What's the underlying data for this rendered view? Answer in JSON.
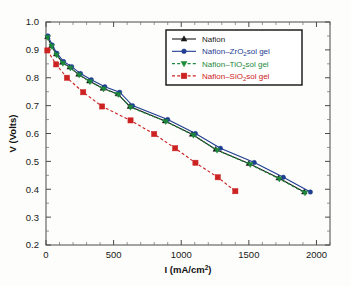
{
  "chart_data": {
    "type": "line",
    "title": "",
    "xlabel": "I (mA/cm2)",
    "xlabel_prefix": "I (mA/cm",
    "xlabel_sup": "2",
    "xlabel_suffix": ")",
    "ylabel": "V (Volts)",
    "xlim": [
      0,
      2100
    ],
    "ylim": [
      0.2,
      1.0
    ],
    "xticks": [
      0,
      500,
      1000,
      1500,
      2000
    ],
    "xticklabels": [
      "0",
      "500",
      "1000",
      "1500",
      "2000"
    ],
    "x_minor_step": 100,
    "yticks": [
      0.2,
      0.3,
      0.4,
      0.5,
      0.6,
      0.7,
      0.8,
      0.9,
      1.0
    ],
    "yticklabels": [
      "0.2",
      "0.3",
      "0.4",
      "0.5",
      "0.6",
      "0.7",
      "0.8",
      "0.9",
      "1.0"
    ],
    "y_minor_step": 0.05,
    "grid": false,
    "legend_position": "upper-right",
    "series": [
      {
        "name": "Nafion",
        "label_prefix": "Nafion",
        "label_sub": "",
        "label_suffix": "",
        "color": "#1a1a1a",
        "marker": "triangle-up",
        "linestyle": "solid",
        "points": [
          [
            10,
            0.947
          ],
          [
            40,
            0.915
          ],
          [
            75,
            0.885
          ],
          [
            120,
            0.855
          ],
          [
            175,
            0.838
          ],
          [
            240,
            0.812
          ],
          [
            320,
            0.788
          ],
          [
            420,
            0.762
          ],
          [
            530,
            0.742
          ],
          [
            620,
            0.697
          ],
          [
            880,
            0.645
          ],
          [
            1080,
            0.597
          ],
          [
            1255,
            0.543
          ],
          [
            1500,
            0.492
          ],
          [
            1720,
            0.44
          ],
          [
            1910,
            0.39
          ]
        ]
      },
      {
        "name": "Nafion-ZrO2sol gel",
        "label_prefix": "Nafion–ZrO",
        "label_sub": "2",
        "label_suffix": "sol gel",
        "color": "#1f3d91",
        "marker": "circle",
        "linestyle": "solid",
        "points": [
          [
            15,
            0.95
          ],
          [
            45,
            0.918
          ],
          [
            80,
            0.888
          ],
          [
            130,
            0.858
          ],
          [
            190,
            0.84
          ],
          [
            255,
            0.815
          ],
          [
            335,
            0.793
          ],
          [
            435,
            0.768
          ],
          [
            545,
            0.748
          ],
          [
            640,
            0.7
          ],
          [
            900,
            0.65
          ],
          [
            1105,
            0.6
          ],
          [
            1290,
            0.547
          ],
          [
            1540,
            0.496
          ],
          [
            1755,
            0.443
          ],
          [
            1955,
            0.39
          ]
        ]
      },
      {
        "name": "Nafion-TiO2sol gel",
        "label_prefix": "Nafion–TiO",
        "label_sub": "2",
        "label_suffix": "sol gel",
        "color": "#1d8a3a",
        "marker": "triangle-down",
        "linestyle": "dashed",
        "points": [
          [
            12,
            0.945
          ],
          [
            42,
            0.913
          ],
          [
            78,
            0.882
          ],
          [
            125,
            0.852
          ],
          [
            180,
            0.835
          ],
          [
            245,
            0.81
          ],
          [
            325,
            0.786
          ],
          [
            425,
            0.76
          ],
          [
            535,
            0.74
          ],
          [
            625,
            0.694
          ],
          [
            885,
            0.643
          ],
          [
            1090,
            0.594
          ],
          [
            1265,
            0.54
          ],
          [
            1510,
            0.489
          ],
          [
            1725,
            0.437
          ],
          [
            1915,
            0.387
          ]
        ]
      },
      {
        "name": "Nafion-SiO2sol gel",
        "label_prefix": "Nafion–SiO",
        "label_sub": "2",
        "label_suffix": "sol gel",
        "color": "#cc2222",
        "marker": "square",
        "linestyle": "dashed",
        "points": [
          [
            10,
            0.898
          ],
          [
            75,
            0.848
          ],
          [
            155,
            0.8
          ],
          [
            275,
            0.748
          ],
          [
            415,
            0.697
          ],
          [
            625,
            0.647
          ],
          [
            800,
            0.598
          ],
          [
            955,
            0.547
          ],
          [
            1105,
            0.495
          ],
          [
            1270,
            0.443
          ],
          [
            1400,
            0.393
          ]
        ]
      }
    ]
  }
}
